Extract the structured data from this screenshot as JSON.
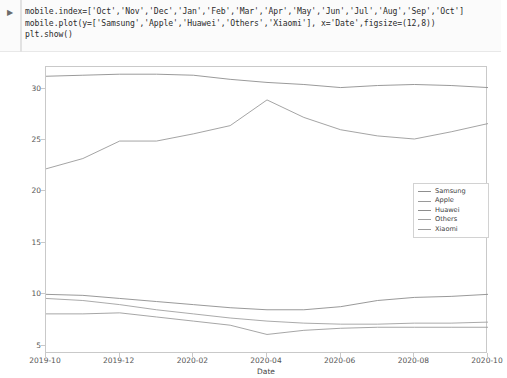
{
  "notebook": {
    "run_marker": "▶",
    "code_lines": [
      "mobile.index=['Oct','Nov','Dec','Jan','Feb','Mar','Apr','May','Jun','Jul','Aug','Sep','Oct']",
      "mobile.plot(y=['Samsung','Apple','Huawei','Others','Xiaomi'], x='Date',figsize=(12,8))",
      "plt.show()"
    ]
  },
  "chart_data": {
    "type": "line",
    "title": "",
    "xlabel": "Date",
    "ylabel": "",
    "grid": false,
    "legend_position": "center right",
    "x": [
      "2019-10",
      "2019-11",
      "2019-12",
      "2020-01",
      "2020-02",
      "2020-03",
      "2020-04",
      "2020-05",
      "2020-06",
      "2020-07",
      "2020-08",
      "2020-09",
      "2020-10"
    ],
    "xtick_labels": [
      "2019-10",
      "2019-12",
      "2020-02",
      "2020-04",
      "2020-06",
      "2020-08",
      "2020-10"
    ],
    "ytick_labels": [
      "5",
      "10",
      "15",
      "20",
      "25",
      "30"
    ],
    "xlim": [
      "2019-10",
      "2020-10"
    ],
    "ylim": [
      4.2,
      32.1
    ],
    "series": [
      {
        "name": "Samsung",
        "color": "#8f8f8f",
        "values": [
          31.2,
          31.3,
          31.4,
          31.4,
          31.3,
          30.9,
          30.6,
          30.4,
          30.1,
          30.3,
          30.4,
          30.3,
          30.1
        ]
      },
      {
        "name": "Apple",
        "color": "#9a9a9a",
        "values": [
          22.2,
          23.2,
          24.9,
          24.9,
          25.6,
          26.4,
          28.9,
          27.2,
          26.0,
          25.4,
          25.1,
          25.8,
          26.6
        ]
      },
      {
        "name": "Huawei",
        "color": "#8d8d8d",
        "values": [
          10.0,
          9.9,
          9.6,
          9.3,
          9.0,
          8.7,
          8.5,
          8.5,
          8.8,
          9.4,
          9.7,
          9.8,
          10.0
        ]
      },
      {
        "name": "Others",
        "color": "#a0a0a0",
        "values": [
          9.6,
          9.4,
          9.0,
          8.5,
          8.1,
          7.7,
          7.4,
          7.2,
          7.1,
          7.1,
          7.2,
          7.2,
          7.3
        ]
      },
      {
        "name": "Xiaomi",
        "color": "#9c9c9c",
        "values": [
          8.1,
          8.1,
          8.2,
          7.8,
          7.4,
          7.0,
          6.1,
          6.5,
          6.7,
          6.8,
          6.8,
          6.8,
          6.8
        ]
      }
    ]
  }
}
